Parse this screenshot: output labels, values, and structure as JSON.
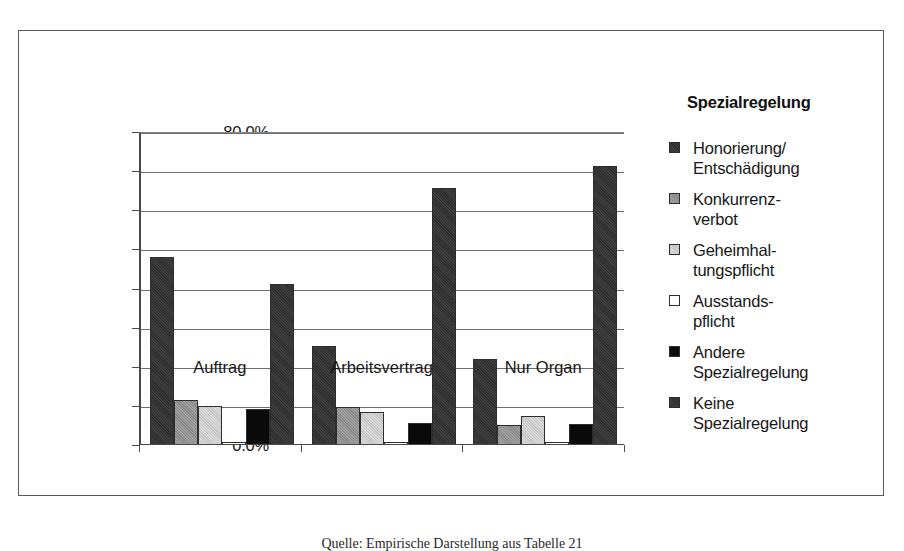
{
  "legend": {
    "title": "Spezialregelung",
    "items": [
      {
        "label": "Honorierung/\nEntschädigung",
        "swatch": "dark-gray-hatched"
      },
      {
        "label": "Konkurrenz-\nverbot",
        "swatch": "medium-gray"
      },
      {
        "label": "Geheimhal-\ntungspflicht",
        "swatch": "light-gray"
      },
      {
        "label": "Ausstands-\npflicht",
        "swatch": "white"
      },
      {
        "label": "Andere\nSpezialregelung",
        "swatch": "black"
      },
      {
        "label": "Keine\nSpezialregelung",
        "swatch": "dark-gray-hatched"
      }
    ]
  },
  "caption": "Quelle: Empirische Darstellung aus Tabelle 21",
  "chart_data": {
    "type": "bar",
    "title": "",
    "xlabel": "",
    "ylabel": "",
    "ylim": [
      0,
      80
    ],
    "ytick_labels": [
      "0.0%",
      "10.0%",
      "20.0%",
      "30.0%",
      "40.0%",
      "50.0%",
      "60.0%",
      "70.0%",
      "80.0%"
    ],
    "ytick_values": [
      0,
      10,
      20,
      30,
      40,
      50,
      60,
      70,
      80
    ],
    "grid": true,
    "legend_position": "right",
    "legend_title": "Spezialregelung",
    "categories": [
      "Auftrag",
      "Arbeitsvertrag",
      "Nur Organ"
    ],
    "series": [
      {
        "name": "Honorierung/Entschädigung",
        "values": [
          48.0,
          25.2,
          21.9
        ]
      },
      {
        "name": "Konkurrenzverbot",
        "values": [
          11.6,
          9.8,
          5.2
        ]
      },
      {
        "name": "Geheimhaltungspflicht",
        "values": [
          9.9,
          8.4,
          7.5
        ]
      },
      {
        "name": "Ausstandspflicht",
        "values": [
          0.7,
          0.8,
          0.7
        ]
      },
      {
        "name": "Andere Spezialregelung",
        "values": [
          9.2,
          5.5,
          5.3
        ]
      },
      {
        "name": "Keine Spezialregelung",
        "values": [
          41.1,
          65.8,
          71.3
        ]
      }
    ]
  }
}
